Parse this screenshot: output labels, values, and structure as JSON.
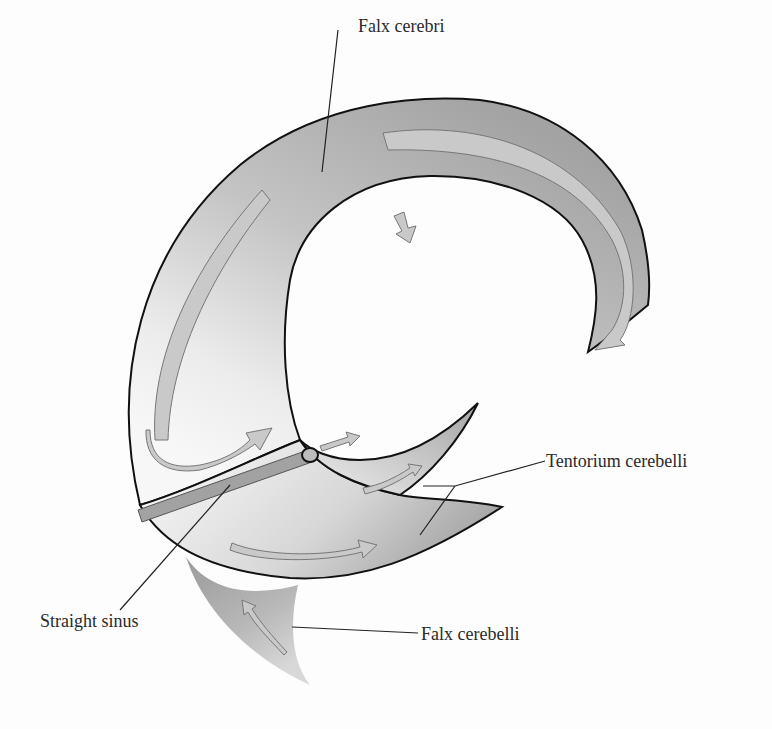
{
  "diagram": {
    "labels": {
      "falx_cerebri": "Falx cerebri",
      "tentorium_cerebelli": "Tentorium cerebelli",
      "straight_sinus": "Straight sinus",
      "falx_cerebelli": "Falx cerebelli"
    },
    "colors": {
      "fold_dark": "#a7a7a7",
      "fold_light": "#f4f4f4",
      "arrow_fill": "#c9c9c9",
      "outline": "#111111",
      "leader_line": "#222222",
      "text": "#2a2a2a",
      "background": "#fdfdfd"
    }
  }
}
